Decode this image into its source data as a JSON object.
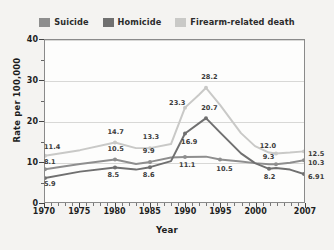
{
  "chart_data": {
    "type": "line",
    "title": "",
    "xlabel": "Year",
    "ylabel": "Rate per 100,000",
    "xlim": [
      1970,
      2007
    ],
    "ylim": [
      0,
      40
    ],
    "yticks": [
      0,
      10,
      20,
      30,
      40
    ],
    "xticks": [
      1970,
      1975,
      1980,
      1985,
      1990,
      1995,
      2000,
      2007
    ],
    "grid": "horizontal",
    "legend_position": "top-center",
    "series": [
      {
        "name": "Suicide",
        "color": "#8e8e8e",
        "x": [
          1970,
          1975,
          1980,
          1983,
          1985,
          1988,
          1990,
          1993,
          1995,
          1998,
          2000,
          2002,
          2003,
          2005,
          2007
        ],
        "values": [
          8.1,
          9.4,
          10.5,
          9.4,
          9.9,
          11.0,
          11.1,
          11.2,
          10.5,
          10.0,
          9.6,
          9.3,
          9.3,
          9.7,
          10.3
        ]
      },
      {
        "name": "Homicide",
        "color": "#707070",
        "x": [
          1970,
          1975,
          1980,
          1983,
          1985,
          1988,
          1990,
          1993,
          1995,
          1998,
          2000,
          2002,
          2003,
          2005,
          2007
        ],
        "values": [
          5.9,
          7.5,
          8.5,
          8.0,
          8.6,
          10.1,
          16.9,
          20.7,
          17.2,
          12.0,
          9.6,
          8.2,
          8.4,
          8.0,
          6.91
        ]
      },
      {
        "name": "Firearm-related death",
        "color": "#c9c9c7",
        "x": [
          1970,
          1975,
          1980,
          1983,
          1985,
          1988,
          1990,
          1992,
          1993,
          1995,
          1998,
          2000,
          2002,
          2003,
          2005,
          2007
        ],
        "values": [
          11.4,
          12.8,
          14.7,
          13.3,
          13.3,
          14.3,
          23.3,
          26.5,
          28.2,
          24.0,
          17.0,
          13.8,
          12.2,
          12.0,
          12.2,
          12.5
        ]
      }
    ],
    "annotations": [
      {
        "text": "11.4",
        "series": "Firearm-related death",
        "year": 1970,
        "value": 11.4,
        "dx": 0,
        "dy": -9
      },
      {
        "text": "8.1",
        "series": "Suicide",
        "year": 1970,
        "value": 8.1,
        "dx": 0,
        "dy": -8
      },
      {
        "text": "5.9",
        "series": "Homicide",
        "year": 1970,
        "value": 5.9,
        "dx": 0,
        "dy": 5
      },
      {
        "text": "14.7",
        "series": "Firearm-related death",
        "year": 1980,
        "value": 14.7,
        "dx": -7,
        "dy": -11
      },
      {
        "text": "10.5",
        "series": "Suicide",
        "year": 1980,
        "value": 10.5,
        "dx": -7,
        "dy": -11
      },
      {
        "text": "8.5",
        "series": "Homicide",
        "year": 1980,
        "value": 8.5,
        "dx": -7,
        "dy": 7
      },
      {
        "text": "13.3",
        "series": "Firearm-related death",
        "year": 1985,
        "value": 13.3,
        "dx": -7,
        "dy": -11
      },
      {
        "text": "9.9",
        "series": "Suicide",
        "year": 1985,
        "value": 9.9,
        "dx": -7,
        "dy": -11
      },
      {
        "text": "8.6",
        "series": "Homicide",
        "year": 1985,
        "value": 8.6,
        "dx": -7,
        "dy": 7
      },
      {
        "text": "23.3",
        "series": "Firearm-related death",
        "year": 1990,
        "value": 23.3,
        "dx": -16,
        "dy": -4
      },
      {
        "text": "16.9",
        "series": "Homicide",
        "year": 1990,
        "value": 16.9,
        "dx": -4,
        "dy": 8
      },
      {
        "text": "11.1",
        "series": "Suicide",
        "year": 1990,
        "value": 11.1,
        "dx": -6,
        "dy": 8
      },
      {
        "text": "28.2",
        "series": "Firearm-related death",
        "year": 1993,
        "value": 28.2,
        "dx": -5,
        "dy": -10
      },
      {
        "text": "20.7",
        "series": "Homicide",
        "year": 1993,
        "value": 20.7,
        "dx": -5,
        "dy": -10
      },
      {
        "text": "10.5",
        "series": "Suicide",
        "year": 1995,
        "value": 10.5,
        "dx": -4,
        "dy": 9
      },
      {
        "text": "12.0",
        "series": "Firearm-related death",
        "year": 2003,
        "value": 12.0,
        "dx": -17,
        "dy": -8
      },
      {
        "text": "9.3",
        "series": "Suicide",
        "year": 2003,
        "value": 9.3,
        "dx": -14,
        "dy": -8
      },
      {
        "text": "8.2",
        "series": "Homicide",
        "year": 2002,
        "value": 8.2,
        "dx": -6,
        "dy": 8
      },
      {
        "text": "12.5",
        "series": "Firearm-related death",
        "year": 2007,
        "value": 12.5,
        "dx": 3,
        "dy": 2
      },
      {
        "text": "10.3",
        "series": "Suicide",
        "year": 2007,
        "value": 10.3,
        "dx": 3,
        "dy": 2
      },
      {
        "text": "6.91",
        "series": "Homicide",
        "year": 2007,
        "value": 6.91,
        "dx": 3,
        "dy": 2
      }
    ]
  },
  "legend": {
    "items": [
      {
        "label": "Suicide",
        "color": "#8e8e8e"
      },
      {
        "label": "Homicide",
        "color": "#707070"
      },
      {
        "label": "Firearm-related death",
        "color": "#c9c9c7"
      }
    ]
  },
  "axes": {
    "y_title": "Rate per 100,000",
    "x_title": "Year",
    "y_ticks": [
      "0",
      "10",
      "20",
      "30",
      "40"
    ],
    "x_ticks": [
      "1970",
      "1975",
      "1980",
      "1985",
      "1990",
      "1995",
      "2000",
      "2007"
    ]
  }
}
